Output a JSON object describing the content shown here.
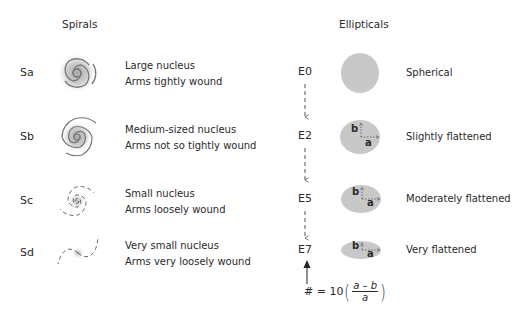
{
  "spirals": {
    "title": "Spirals",
    "items": [
      {
        "class": "Sa",
        "line1": "Large nucleus",
        "line2": "Arms tightly wound",
        "icon": "spiral-galaxy-tight-icon"
      },
      {
        "class": "Sb",
        "line1": "Medium-sized nucleus",
        "line2": "Arms not so tightly wound",
        "icon": "spiral-galaxy-medium-icon"
      },
      {
        "class": "Sc",
        "line1": "Small nucleus",
        "line2": "Arms loosely wound",
        "icon": "spiral-galaxy-loose-icon"
      },
      {
        "class": "Sd",
        "line1": "Very small nucleus",
        "line2": "Arms very loosely wound",
        "icon": "spiral-galaxy-very-loose-icon"
      }
    ]
  },
  "ellipticals": {
    "title": "Ellipticals",
    "items": [
      {
        "class": "E0",
        "desc": "Spherical"
      },
      {
        "class": "E2",
        "desc": "Slightly flattened",
        "axis_b": "b",
        "axis_a": "a"
      },
      {
        "class": "E5",
        "desc": "Moderately flattened",
        "axis_b": "b",
        "axis_a": "a"
      },
      {
        "class": "E7",
        "desc": "Very flattened",
        "axis_b": "b",
        "axis_a": "a"
      }
    ],
    "formula": {
      "lhs": "# = 10",
      "numerator": "a – b",
      "denominator": "a",
      "open_paren": "(",
      "close_paren": ")"
    }
  },
  "colors": {
    "galaxy_fill": "#c8c8c8",
    "arm_stroke": "#777777",
    "text": "#2a2a2a"
  }
}
